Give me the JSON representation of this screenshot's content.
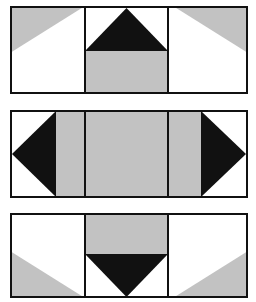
{
  "figure": {
    "background": "#ffffff",
    "canvas": {
      "width": 256,
      "height": 302
    }
  },
  "colors": {
    "black": "#111111",
    "gray": "#c2c2c2",
    "white": "#ffffff",
    "outline": "#111111",
    "background": "#ffffff"
  },
  "geometry": {
    "panel_left": 10,
    "panel_width": 238,
    "divider_1_fraction": 0.315,
    "divider_2_fraction": 0.664,
    "stroke_width": 2
  },
  "panels": [
    {
      "id": "panel-1",
      "name": "top-block",
      "top": 6,
      "height": 88,
      "cells": [
        {
          "id": "p1-cell-left",
          "name": "top-left-cell",
          "fill": "white",
          "shape": "corner-triangle",
          "shape_fill": "gray",
          "corner": "top-left",
          "description": "White square with gray triangle filling the upper-left corner"
        },
        {
          "id": "p1-cell-center",
          "name": "top-center-cell",
          "fill": "white",
          "shape": "triangle-up-over-bar",
          "shape_fill": "black",
          "bar_fill": "gray",
          "bar_position": "bottom",
          "description": "Black upward-pointing triangle on white over a gray lower band"
        },
        {
          "id": "p1-cell-right",
          "name": "top-right-cell",
          "fill": "white",
          "shape": "corner-triangle",
          "shape_fill": "gray",
          "corner": "top-right",
          "description": "White square with gray triangle filling the upper-right corner"
        }
      ]
    },
    {
      "id": "panel-2",
      "name": "middle-block",
      "top": 110,
      "height": 88,
      "cells": [
        {
          "id": "p2-cell-left",
          "name": "middle-left-cell",
          "fill": "white",
          "shape": "triangle-left",
          "shape_fill": "black",
          "description": "Black triangle pointing left, apex touching the left edge midpoint"
        },
        {
          "id": "p2-cell-center",
          "name": "middle-center-cell",
          "fill": "gray",
          "shape": "solid",
          "shape_fill": "gray",
          "description": "Solid gray rectangle spanning the central cell"
        },
        {
          "id": "p2-cell-right",
          "name": "middle-right-cell",
          "fill": "white",
          "shape": "triangle-right",
          "shape_fill": "black",
          "description": "Black triangle pointing right, apex touching the right edge midpoint"
        }
      ],
      "extra_bands": [
        {
          "name": "gray-band-left",
          "fill": "gray",
          "position": "between left cell and center"
        },
        {
          "name": "gray-band-right",
          "fill": "gray",
          "position": "between center and right cell"
        }
      ]
    },
    {
      "id": "panel-3",
      "name": "bottom-block",
      "top": 213,
      "height": 85,
      "cells": [
        {
          "id": "p3-cell-left",
          "name": "bottom-left-cell",
          "fill": "white",
          "shape": "corner-triangle",
          "shape_fill": "gray",
          "corner": "bottom-left",
          "description": "White square with gray triangle filling the lower-left corner"
        },
        {
          "id": "p3-cell-center",
          "name": "bottom-center-cell",
          "fill": "white",
          "shape": "triangle-down-under-bar",
          "shape_fill": "black",
          "bar_fill": "gray",
          "bar_position": "top",
          "description": "Gray upper band over a black downward-pointing triangle on white"
        },
        {
          "id": "p3-cell-right",
          "name": "bottom-right-cell",
          "fill": "white",
          "shape": "corner-triangle",
          "shape_fill": "gray",
          "corner": "bottom-right",
          "description": "White square with gray triangle filling the lower-right corner"
        }
      ]
    }
  ]
}
